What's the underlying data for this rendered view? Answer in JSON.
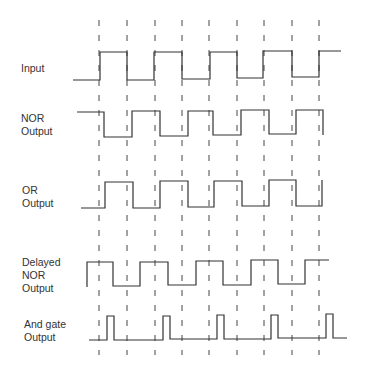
{
  "labels": {
    "input": "Input",
    "nor_1": "NOR",
    "nor_2": "Output",
    "or_1": "OR",
    "or_2": "Output",
    "delayed_1": "Delayed",
    "delayed_2": "NOR",
    "delayed_3": "Output",
    "and_1": "And gate",
    "and_2": "Output"
  },
  "colors": {
    "line": "#333333",
    "dash": "#444444"
  },
  "dashed_lines_x": [
    99,
    127,
    155,
    182,
    209,
    237,
    264,
    292,
    319
  ],
  "waveforms": {
    "input": "M73,80 L100,80 L100,52 L127,52 L127,80 L154,80 L154,52 L182,52 L182,79 L210,79 L210,52 L237,52 L237,78 L263,78 L263,51 L292,51 L292,77 L319,77 L319,51 L341,51",
    "nor": "M77,112 L104,112 L104,137 L132,137 L132,111 L160,111 L160,136 L188,136 L188,111 L213,111 L213,135 L241,135 L241,110 L269,110 L269,134 L296,134 L296,110 L323,110 L323,135",
    "or": "M81,208 L105,208 L105,182 L133,182 L133,208 L160,208 L160,181 L188,181 L188,207 L214,207 L214,181 L242,181 L242,206 L269,206 L269,180 L296,180 L296,206 L322,206 L322,180",
    "delayed_nor": "M87,287 L87,262 L113,262 L113,286 L140,286 L140,262 L168,262 L168,285 L196,285 L196,261 L223,261 L223,285 L251,285 L251,260 L278,260 L278,284 L305,284 L305,260 L329,260",
    "and": "M89,340 L107,340 L107,316 L114,316 L114,340 L163,340 L163,316 L170,316 L170,339 L217,339 L217,315 L224,315 L224,339 L271,339 L271,315 L278,315 L278,338 L326,338 L326,314 L333,314 L333,338 L347,338"
  }
}
